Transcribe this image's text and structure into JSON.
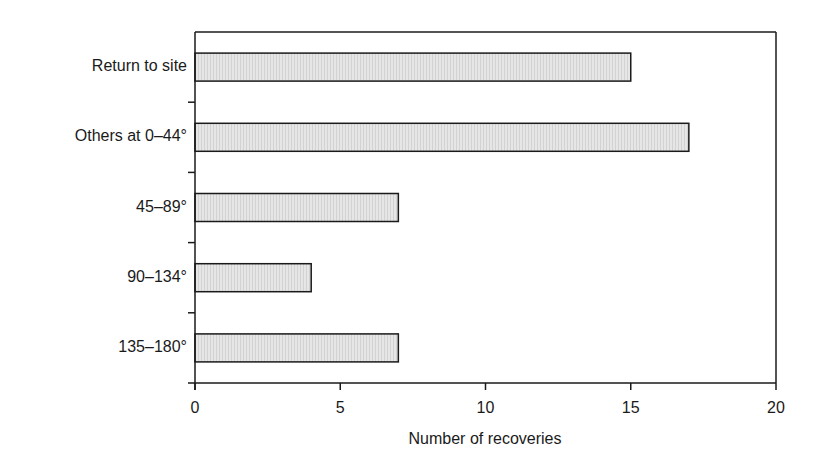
{
  "chart_data": {
    "type": "bar",
    "orientation": "horizontal",
    "title": "",
    "categories": [
      "Return to site",
      "Others at 0–44°",
      "45–89°",
      "90–134°",
      "135–180°"
    ],
    "values": [
      15,
      17,
      7,
      4,
      7
    ],
    "xlabel": "Number of recoveries",
    "ylabel": "",
    "xlim": [
      0,
      20
    ],
    "x_ticks": [
      "0",
      "5",
      "10",
      "15",
      "20"
    ],
    "grid": false,
    "legend": null,
    "colors": {
      "bar_fill": "#e3e3e3",
      "bar_stroke": "#1a1a1a",
      "axis": "#1a1a1a"
    }
  }
}
